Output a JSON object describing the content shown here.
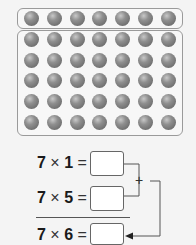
{
  "array": {
    "top_row": {
      "rows": 1,
      "cols": 7
    },
    "bottom_block": {
      "rows": 5,
      "cols": 7
    }
  },
  "equations": [
    {
      "left": "7",
      "op": "×",
      "right": "1",
      "eq": "=",
      "answer": ""
    },
    {
      "left": "7",
      "op": "×",
      "right": "5",
      "eq": "=",
      "answer": ""
    },
    {
      "left": "7",
      "op": "×",
      "right": "6",
      "eq": "=",
      "answer": ""
    }
  ],
  "connector": {
    "symbol": "+"
  }
}
